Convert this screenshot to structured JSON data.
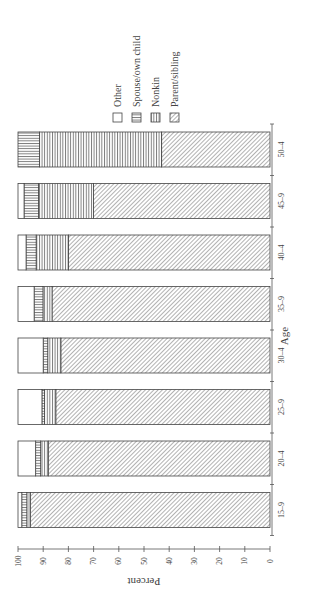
{
  "chart_data": {
    "type": "bar",
    "stacked": true,
    "orientation": "rotated-horizontal",
    "title": "",
    "xlabel": "Age",
    "ylabel": "Percent",
    "ylim": [
      0,
      100
    ],
    "y_ticks": [
      0,
      10,
      20,
      30,
      40,
      50,
      60,
      70,
      80,
      90,
      100
    ],
    "categories": [
      "15–9",
      "20–4",
      "25–9",
      "30–4",
      "35–9",
      "40–4",
      "45–9",
      "50–4"
    ],
    "series": [
      {
        "name": "Parent/sibling",
        "pattern": "diagonal",
        "values": [
          95,
          88,
          85,
          83,
          86.5,
          80,
          70,
          43
        ]
      },
      {
        "name": "Nonkin",
        "pattern": "vertical-lines",
        "values": [
          1.5,
          3,
          4.5,
          5.2,
          3.6,
          12.8,
          21.9,
          48.5
        ]
      },
      {
        "name": "Spouse/own child",
        "pattern": "horizontal-lines",
        "values": [
          2,
          2,
          1,
          1.8,
          3.5,
          4,
          5.7,
          8.5
        ]
      },
      {
        "name": "Other",
        "pattern": "blank",
        "values": [
          1.5,
          7,
          9.5,
          10,
          6.4,
          3.2,
          2.4,
          0
        ]
      }
    ],
    "legend": {
      "position": "top",
      "entries": [
        "Other",
        "Spouse/own child",
        "Nonkin",
        "Parent/sibling"
      ]
    },
    "grid": false
  },
  "labels": {
    "xlabel": "Age",
    "ylabel": "Percent"
  }
}
